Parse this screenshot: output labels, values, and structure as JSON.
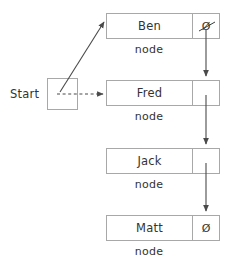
{
  "diagram": {
    "type": "linked-list",
    "colors": {
      "box_border": "#a8a8a8",
      "text": "#333333",
      "arrow": "#4a4a4a",
      "background": "#ffffff"
    },
    "start": {
      "label": "Start",
      "box_name": "start-pointer-box",
      "value": ""
    },
    "node_caption": "node",
    "nodes": [
      {
        "id": "node-ben",
        "data": "Ben",
        "pointer_symbol": "Ø",
        "pointer_state": "struck-out-null",
        "caption": "node"
      },
      {
        "id": "node-fred",
        "data": "Fred",
        "pointer_symbol": "",
        "pointer_state": "link",
        "caption": "node"
      },
      {
        "id": "node-jack",
        "data": "Jack",
        "pointer_symbol": "",
        "pointer_state": "link",
        "caption": "node"
      },
      {
        "id": "node-matt",
        "data": "Matt",
        "pointer_symbol": "Ø",
        "pointer_state": "null",
        "caption": "node"
      }
    ],
    "edges": [
      {
        "id": "edge-start-to-fred",
        "from": "start",
        "to": "node-fred",
        "style": "dashed",
        "meaning": "old link"
      },
      {
        "id": "edge-start-to-ben",
        "from": "start",
        "to": "node-ben",
        "style": "solid",
        "meaning": "new link"
      },
      {
        "id": "edge-ben-to-fred",
        "from": "node-ben",
        "to": "node-fred",
        "style": "solid",
        "meaning": "next"
      },
      {
        "id": "edge-fred-to-jack",
        "from": "node-fred",
        "to": "node-jack",
        "style": "solid",
        "meaning": "next"
      },
      {
        "id": "edge-jack-to-matt",
        "from": "node-jack",
        "to": "node-matt",
        "style": "solid",
        "meaning": "next"
      }
    ]
  }
}
